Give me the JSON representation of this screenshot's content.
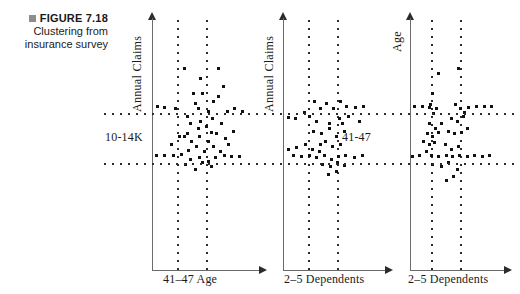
{
  "caption": {
    "bullet_icon": "square-bullet-icon",
    "figure_label": "FIGURE 7.18",
    "line1": "Clustering from",
    "line2": "insurance survey"
  },
  "colors": {
    "ink": "#111111",
    "axis": "#6b6b6b",
    "bullet": "#8d8d8d",
    "background": "#ffffff"
  },
  "chart_data": [
    {
      "id": "chart-1",
      "type": "scatter",
      "title": "",
      "ylabel": "Annual Claims",
      "xlabel": "41–47 Age",
      "cluster_label": "10-14K",
      "cluster_label_position": "left",
      "grid": true,
      "legend": false,
      "guides": {
        "vertical": [
          0.3,
          0.62
        ],
        "horizontal": [
          0.355,
          0.545
        ]
      },
      "points": [
        [
          0.33,
          0.39
        ],
        [
          0.33,
          0.46
        ],
        [
          0.4,
          0.34
        ],
        [
          0.43,
          0.36
        ],
        [
          0.47,
          0.3
        ],
        [
          0.52,
          0.37
        ],
        [
          0.57,
          0.33
        ],
        [
          0.62,
          0.31
        ],
        [
          0.36,
          0.42
        ],
        [
          0.45,
          0.41
        ],
        [
          0.5,
          0.43
        ],
        [
          0.56,
          0.4
        ],
        [
          0.64,
          0.42
        ],
        [
          0.7,
          0.37
        ],
        [
          0.76,
          0.36
        ],
        [
          0.84,
          0.37
        ],
        [
          0.22,
          0.36
        ],
        [
          0.12,
          0.355
        ],
        [
          0.05,
          0.352
        ],
        [
          0.3,
          0.47
        ],
        [
          0.37,
          0.49
        ],
        [
          0.44,
          0.47
        ],
        [
          0.52,
          0.49
        ],
        [
          0.6,
          0.46
        ],
        [
          0.68,
          0.48
        ],
        [
          0.75,
          0.45
        ],
        [
          0.25,
          0.47
        ],
        [
          0.18,
          0.5
        ],
        [
          0.34,
          0.525
        ],
        [
          0.41,
          0.51
        ],
        [
          0.49,
          0.53
        ],
        [
          0.57,
          0.51
        ],
        [
          0.63,
          0.53
        ],
        [
          0.71,
          0.5
        ],
        [
          0.27,
          0.54
        ],
        [
          0.2,
          0.545
        ],
        [
          0.12,
          0.545
        ],
        [
          0.04,
          0.545
        ],
        [
          0.36,
          0.56
        ],
        [
          0.44,
          0.555
        ],
        [
          0.52,
          0.57
        ],
        [
          0.59,
          0.555
        ],
        [
          0.67,
          0.545
        ],
        [
          0.74,
          0.55
        ],
        [
          0.81,
          0.548
        ],
        [
          0.31,
          0.58
        ],
        [
          0.4,
          0.6
        ],
        [
          0.47,
          0.575
        ],
        [
          0.55,
          0.59
        ],
        [
          0.45,
          0.24
        ],
        [
          0.3,
          0.2
        ],
        [
          0.62,
          0.2
        ],
        [
          0.38,
          0.3
        ],
        [
          0.66,
          0.27
        ],
        [
          0.55,
          0.455
        ],
        [
          0.43,
          0.44
        ]
      ]
    },
    {
      "id": "chart-2",
      "type": "scatter",
      "title": "",
      "ylabel": "Annual Claims",
      "xlabel": "2–5 Dependents",
      "cluster_label": "41-47",
      "cluster_label_position": "right",
      "grid": true,
      "legend": false,
      "guides": {
        "vertical": [
          0.3,
          0.6
        ],
        "horizontal": [
          0.355,
          0.545
        ]
      },
      "points": [
        [
          0.31,
          0.33
        ],
        [
          0.36,
          0.36
        ],
        [
          0.42,
          0.34
        ],
        [
          0.49,
          0.36
        ],
        [
          0.56,
          0.33
        ],
        [
          0.62,
          0.35
        ],
        [
          0.7,
          0.355
        ],
        [
          0.78,
          0.35
        ],
        [
          0.21,
          0.375
        ],
        [
          0.26,
          0.39
        ],
        [
          0.33,
          0.41
        ],
        [
          0.45,
          0.42
        ],
        [
          0.55,
          0.4
        ],
        [
          0.64,
          0.39
        ],
        [
          0.74,
          0.41
        ],
        [
          0.12,
          0.4
        ],
        [
          0.05,
          0.395
        ],
        [
          0.3,
          0.45
        ],
        [
          0.37,
          0.46
        ],
        [
          0.45,
          0.44
        ],
        [
          0.52,
          0.47
        ],
        [
          0.6,
          0.45
        ],
        [
          0.41,
          0.49
        ],
        [
          0.48,
          0.51
        ],
        [
          0.56,
          0.5
        ],
        [
          0.22,
          0.5
        ],
        [
          0.29,
          0.52
        ],
        [
          0.35,
          0.53
        ],
        [
          0.13,
          0.515
        ],
        [
          0.05,
          0.52
        ],
        [
          0.33,
          0.555
        ],
        [
          0.4,
          0.545
        ],
        [
          0.47,
          0.56
        ],
        [
          0.54,
          0.55
        ],
        [
          0.61,
          0.545
        ],
        [
          0.69,
          0.555
        ],
        [
          0.77,
          0.545
        ],
        [
          0.26,
          0.545
        ],
        [
          0.18,
          0.548
        ],
        [
          0.1,
          0.545
        ],
        [
          0.38,
          0.58
        ],
        [
          0.46,
          0.59
        ],
        [
          0.53,
          0.575
        ],
        [
          0.6,
          0.585
        ],
        [
          0.44,
          0.62
        ],
        [
          0.52,
          0.61
        ],
        [
          0.36,
          0.5
        ],
        [
          0.58,
          0.42
        ]
      ]
    },
    {
      "id": "chart-3",
      "type": "scatter",
      "title": "",
      "ylabel": "Age",
      "xlabel": "2–5 Dependents",
      "cluster_label": "",
      "cluster_label_position": "none",
      "grid": true,
      "legend": false,
      "guides": {
        "vertical": [
          0.22,
          0.52
        ],
        "horizontal": [
          0.345,
          0.545
        ]
      },
      "points": [
        [
          0.24,
          0.3
        ],
        [
          0.22,
          0.345
        ],
        [
          0.28,
          0.36
        ],
        [
          0.25,
          0.38
        ],
        [
          0.2,
          0.355
        ],
        [
          0.13,
          0.352
        ],
        [
          0.05,
          0.35
        ],
        [
          0.48,
          0.345
        ],
        [
          0.53,
          0.36
        ],
        [
          0.57,
          0.375
        ],
        [
          0.62,
          0.355
        ],
        [
          0.7,
          0.352
        ],
        [
          0.78,
          0.35
        ],
        [
          0.86,
          0.352
        ],
        [
          0.44,
          0.4
        ],
        [
          0.5,
          0.41
        ],
        [
          0.56,
          0.39
        ],
        [
          0.21,
          0.42
        ],
        [
          0.27,
          0.44
        ],
        [
          0.33,
          0.42
        ],
        [
          0.18,
          0.46
        ],
        [
          0.24,
          0.47
        ],
        [
          0.3,
          0.455
        ],
        [
          0.4,
          0.45
        ],
        [
          0.47,
          0.46
        ],
        [
          0.54,
          0.455
        ],
        [
          0.6,
          0.44
        ],
        [
          0.14,
          0.49
        ],
        [
          0.2,
          0.5
        ],
        [
          0.26,
          0.495
        ],
        [
          0.37,
          0.5
        ],
        [
          0.44,
          0.52
        ],
        [
          0.51,
          0.51
        ],
        [
          0.17,
          0.53
        ],
        [
          0.23,
          0.545
        ],
        [
          0.3,
          0.548
        ],
        [
          0.38,
          0.545
        ],
        [
          0.45,
          0.55
        ],
        [
          0.52,
          0.545
        ],
        [
          0.6,
          0.548
        ],
        [
          0.68,
          0.545
        ],
        [
          0.76,
          0.548
        ],
        [
          0.84,
          0.545
        ],
        [
          0.1,
          0.545
        ],
        [
          0.03,
          0.548
        ],
        [
          0.24,
          0.58
        ],
        [
          0.33,
          0.59
        ],
        [
          0.41,
          0.575
        ],
        [
          0.5,
          0.6
        ],
        [
          0.46,
          0.63
        ],
        [
          0.38,
          0.645
        ],
        [
          0.3,
          0.22
        ],
        [
          0.51,
          0.2
        ]
      ]
    }
  ]
}
